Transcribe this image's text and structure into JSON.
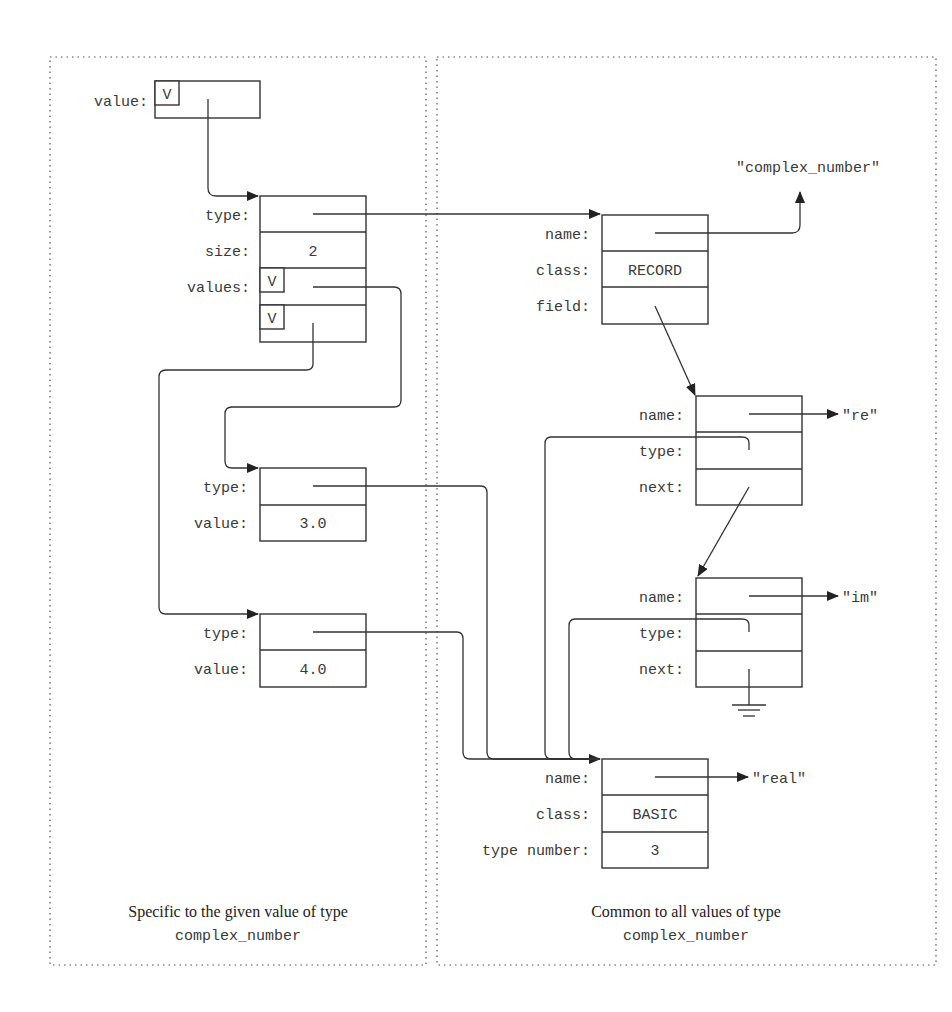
{
  "left_panel": {
    "caption_line1": "Specific to the given value of type",
    "caption_line2": "complex_number",
    "root": {
      "label": "value:",
      "tag": "V"
    },
    "array": {
      "labels": {
        "type": "type:",
        "size": "size:",
        "values": "values:"
      },
      "size_value": "2",
      "tags": [
        "V",
        "V"
      ]
    },
    "elem1": {
      "type_label": "type:",
      "value_label": "value:",
      "value": "3.0"
    },
    "elem2": {
      "type_label": "type:",
      "value_label": "value:",
      "value": "4.0"
    }
  },
  "right_panel": {
    "caption_line1": "Common to all values of type",
    "caption_line2": "complex_number",
    "record": {
      "labels": {
        "name": "name:",
        "class": "class:",
        "field": "field:"
      },
      "class_value": "RECORD",
      "name_string": "\"complex_number\""
    },
    "field_re": {
      "labels": {
        "name": "name:",
        "type": "type:",
        "next": "next:"
      },
      "name_string": "\"re\""
    },
    "field_im": {
      "labels": {
        "name": "name:",
        "type": "type:",
        "next": "next:"
      },
      "name_string": "\"im\""
    },
    "basic": {
      "labels": {
        "name": "name:",
        "class": "class:",
        "type_number": "type number:"
      },
      "class_value": "BASIC",
      "type_number_value": "3",
      "name_string": "\"real\""
    }
  },
  "icons": {
    "pointer_arrow": "arrowhead",
    "null_pointer": "ground-symbol"
  },
  "colors": {
    "line": "#333333",
    "text": "#3a3a3a",
    "background": "#ffffff"
  }
}
